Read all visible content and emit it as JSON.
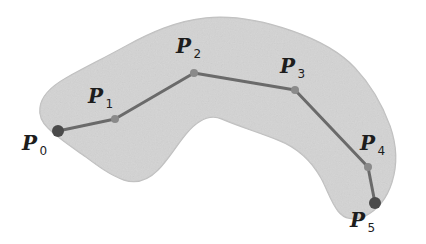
{
  "figure": {
    "kind": "geometric-diagram",
    "background_color": "#ffffff",
    "blob": {
      "fill_color": "#d9d9d9",
      "edge_color": "#bfbfbf",
      "texture": "paper-grain"
    },
    "polyline": {
      "stroke_color": "#6a6a6a",
      "stroke_width": 3
    },
    "markers": {
      "endpoint_color": "#4a4a4a",
      "endpoint_radius": 6,
      "interior_color": "#8a8a8a",
      "interior_radius": 4
    }
  },
  "points": [
    {
      "id": "p0",
      "glyph": "P",
      "subscript": "0",
      "x": 58,
      "y": 131,
      "role": "endpoint"
    },
    {
      "id": "p1",
      "glyph": "P",
      "subscript": "1",
      "x": 115,
      "y": 119,
      "role": "interior"
    },
    {
      "id": "p2",
      "glyph": "P",
      "subscript": "2",
      "x": 194,
      "y": 73,
      "role": "interior"
    },
    {
      "id": "p3",
      "glyph": "P",
      "subscript": "3",
      "x": 295,
      "y": 90,
      "role": "interior"
    },
    {
      "id": "p4",
      "glyph": "P",
      "subscript": "4",
      "x": 368,
      "y": 167,
      "role": "interior"
    },
    {
      "id": "p5",
      "glyph": "P",
      "subscript": "5",
      "x": 375,
      "y": 203,
      "role": "endpoint"
    }
  ],
  "labels": {
    "p0": {
      "glyph": "P",
      "subscript": "0"
    },
    "p1": {
      "glyph": "P",
      "subscript": "1"
    },
    "p2": {
      "glyph": "P",
      "subscript": "2"
    },
    "p3": {
      "glyph": "P",
      "subscript": "3"
    },
    "p4": {
      "glyph": "P",
      "subscript": "4"
    },
    "p5": {
      "glyph": "P",
      "subscript": "5"
    }
  },
  "blob_outline": "M 40,108 C 41,96 52,86 66,78 C 84,68 104,58 126,46 C 150,33 176,21 206,18 C 236,15 266,22 292,31 C 318,40 340,52 355,68 C 370,84 382,104 390,126 C 397,146 397,166 392,182 C 387,198 377,210 365,216 C 354,221 344,219 338,211 C 331,202 327,189 321,178 C 311,160 296,147 278,140 C 258,132 238,126 222,119 C 208,113 196,122 186,134 C 176,146 168,160 158,170 C 148,180 136,184 124,180 C 110,175 98,166 86,157 C 72,147 58,138 48,128 C 41,121 39,115 40,108 Z"
}
